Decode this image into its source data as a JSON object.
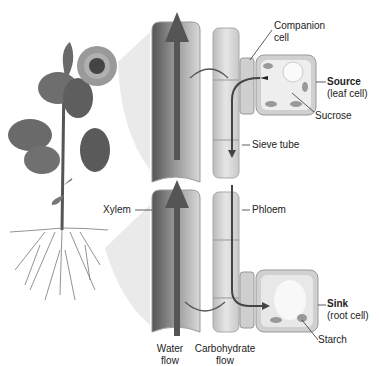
{
  "diagram": {
    "type": "plant vascular transport (xylem and phloem)",
    "labels": {
      "companion_cell": [
        "Companion",
        "cell"
      ],
      "source": {
        "title": "Source",
        "subtitle": "(leaf cell)"
      },
      "sucrose": "Sucrose",
      "sieve_tube": "Sieve tube",
      "xylem": "Xylem",
      "phloem": "Phloem",
      "sink": {
        "title": "Sink",
        "subtitle": "(root cell)"
      },
      "starch": "Starch",
      "water_flow": [
        "Water",
        "flow"
      ],
      "carbohydrate_flow": [
        "Carbohydrate",
        "flow"
      ]
    },
    "illustration": {
      "plant": "sunflower with leaves and roots",
      "water_flow_direction": "upward through xylem",
      "carbohydrate_flow_direction": "downward through phloem from source to sink"
    }
  }
}
